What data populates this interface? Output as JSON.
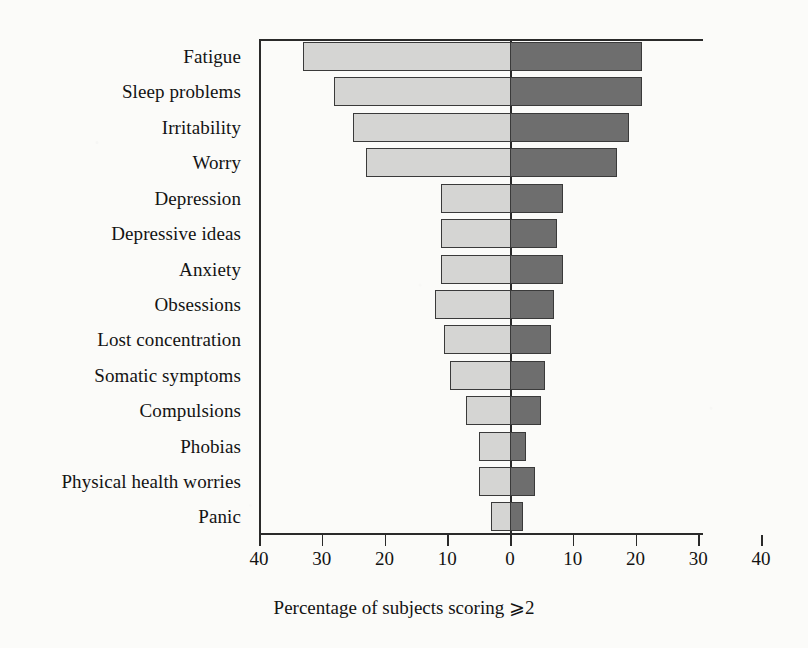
{
  "chart_data": {
    "type": "bar",
    "orientation": "horizontal",
    "subtype": "diverging-paired-bar",
    "title": "",
    "subtitle": "",
    "xlabel": "Percentage of subjects scoring ⩾2",
    "ylabel": "",
    "xlim": [
      -40,
      40
    ],
    "xticks": [
      -40,
      -30,
      -20,
      -10,
      0,
      10,
      20,
      30,
      40
    ],
    "xticklabels": [
      "40",
      "30",
      "20",
      "10",
      "0",
      "10",
      "20",
      "30",
      "40"
    ],
    "grid": false,
    "legend": null,
    "axis_note": "x-axis is mirrored: values increase outward from 0 in both directions",
    "categories": [
      "Fatigue",
      "Sleep problems",
      "Irritability",
      "Worry",
      "Depression",
      "Depressive ideas",
      "Anxiety",
      "Obsessions",
      "Lost concentration",
      "Somatic symptoms",
      "Compulsions",
      "Phobias",
      "Physical health worries",
      "Panic"
    ],
    "series": [
      {
        "name": "left",
        "side": "left",
        "color": "#d5d5d3",
        "values": [
          33,
          28,
          25,
          23,
          11,
          11,
          11,
          12,
          10.5,
          9.5,
          7,
          5,
          5,
          3
        ]
      },
      {
        "name": "right",
        "side": "right",
        "color": "#6e6e6e",
        "values": [
          21,
          21,
          19,
          17,
          8.5,
          7.5,
          8.5,
          7,
          6.5,
          5.5,
          5,
          2.5,
          4,
          2
        ]
      }
    ]
  },
  "colors": {
    "left_fill": "#d5d5d3",
    "right_fill": "#6e6e6e",
    "bar_stroke": "#3a3a3a",
    "axis": "#2a2a2a",
    "background": "#fbfbf9",
    "text": "#131313"
  }
}
